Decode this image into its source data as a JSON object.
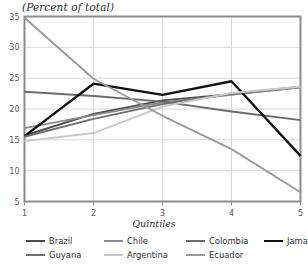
{
  "chart_data": {
    "type": "line",
    "title": "(Percent of total)",
    "xlabel": "Quintiles",
    "ylabel": "",
    "x": [
      1,
      2,
      3,
      4,
      5
    ],
    "xticklabels": [
      "1",
      "2",
      "3",
      "4",
      "5"
    ],
    "yticklabels": [
      "5",
      "10",
      "15",
      "20",
      "25",
      "30",
      "35"
    ],
    "yticks": [
      5,
      10,
      15,
      20,
      25,
      30,
      35
    ],
    "xlim": [
      1,
      5
    ],
    "ylim": [
      5,
      35
    ],
    "grid": true,
    "legend_position": "bottom",
    "series": [
      {
        "name": "Brazil",
        "values": [
          15.7,
          19.2,
          21.4,
          22.4,
          23.5
        ],
        "color": "#4d4d4d",
        "width": 1.9
      },
      {
        "name": "Chile",
        "values": [
          16.9,
          19.0,
          21.1,
          22.3,
          23.5
        ],
        "color": "#8a8a8a",
        "width": 1.9
      },
      {
        "name": "Colombia",
        "values": [
          22.8,
          22.1,
          21.2,
          19.6,
          18.2
        ],
        "color": "#6b6b6b",
        "width": 1.9
      },
      {
        "name": "Jamaica",
        "values": [
          15.6,
          24.1,
          22.3,
          24.5,
          12.4
        ],
        "color": "#111111",
        "width": 2.3
      },
      {
        "name": "Guyana",
        "values": [
          15.5,
          18.4,
          20.8,
          22.5,
          23.6
        ],
        "color": "#6f6f6f",
        "width": 1.9
      },
      {
        "name": "Argentina",
        "values": [
          14.8,
          16.1,
          20.4,
          22.6,
          23.6
        ],
        "color": "#c8c8c8",
        "width": 1.9
      },
      {
        "name": "Ecuador",
        "values": [
          34.8,
          24.9,
          18.9,
          13.5,
          6.5
        ],
        "color": "#9a9a9a",
        "width": 1.9
      }
    ]
  },
  "legend": {
    "rows": [
      [
        {
          "label": "Brazil"
        },
        {
          "label": "Chile"
        },
        {
          "label": "Colombia"
        },
        {
          "label": "Jamaica"
        }
      ],
      [
        {
          "label": "Guyana"
        },
        {
          "label": "Argentina"
        },
        {
          "label": "Ecuador"
        }
      ]
    ]
  },
  "style": {
    "frame_color": "#8c8c8c",
    "grid_color": "#d9d9d9",
    "tick_color": "#555555",
    "background": "#ffffff"
  }
}
